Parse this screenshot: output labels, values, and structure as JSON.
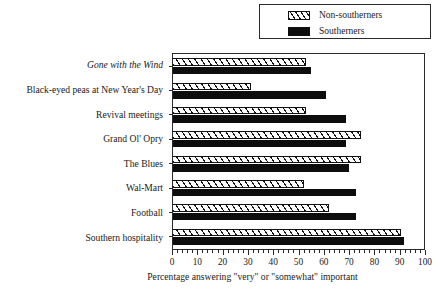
{
  "chart_data": {
    "type": "bar",
    "orientation": "horizontal",
    "title": "",
    "xlabel": "Percentage answering \"very\" or \"somewhat\" important",
    "ylabel": "",
    "xlim": [
      0,
      100
    ],
    "xticks": [
      0,
      10,
      20,
      30,
      40,
      50,
      60,
      70,
      80,
      90,
      100
    ],
    "xtick_labels": [
      "0",
      "10",
      "20",
      "30",
      "40",
      "50",
      "60",
      "70",
      "80",
      "90",
      "100"
    ],
    "minor_tick_step": 2,
    "grid": false,
    "legend_position": "top-right",
    "categories": [
      "Gone with the Wind",
      "Black-eyed peas at New Year's Day",
      "Revival meetings",
      "Grand Ol' Opry",
      "The Blues",
      "Wal-Mart",
      "Football",
      "Southern hospitality"
    ],
    "category_styles": [
      "italic",
      "normal",
      "normal",
      "normal",
      "normal",
      "normal",
      "normal",
      "normal"
    ],
    "series": [
      {
        "name": "Non-southerners",
        "fill": "hatched",
        "color": "#ffffff",
        "edge_color": "#111111",
        "values": [
          53,
          31,
          53,
          75,
          75,
          52,
          62,
          91
        ]
      },
      {
        "name": "Southerners",
        "fill": "solid",
        "color": "#0d0d0d",
        "edge_color": "#0d0d0d",
        "values": [
          55,
          61,
          69,
          69,
          70,
          73,
          73,
          92
        ]
      }
    ]
  },
  "legend": {
    "items": [
      {
        "label": "Non-southerners",
        "swatch": "hatched-swatch"
      },
      {
        "label": "Southerners",
        "swatch": "solid-swatch"
      }
    ]
  },
  "axis": {
    "x_title": "Percentage answering \"very\" or \"somewhat\" important"
  }
}
